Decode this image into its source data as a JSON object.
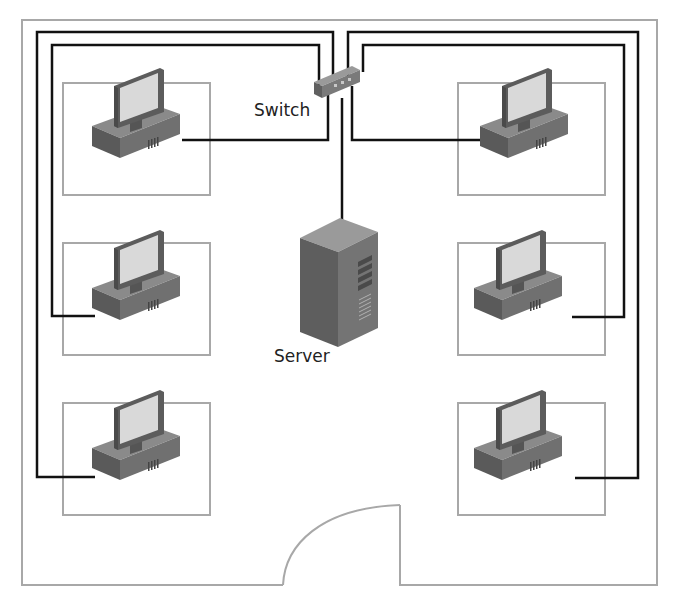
{
  "diagram": {
    "type": "network floor plan",
    "labels": {
      "switch": "Switch",
      "server": "Server"
    },
    "nodes": [
      {
        "id": "switch",
        "kind": "switch",
        "label": "Switch"
      },
      {
        "id": "server",
        "kind": "server",
        "label": "Server"
      },
      {
        "id": "pc-left-1",
        "kind": "workstation"
      },
      {
        "id": "pc-left-2",
        "kind": "workstation"
      },
      {
        "id": "pc-left-3",
        "kind": "workstation"
      },
      {
        "id": "pc-right-1",
        "kind": "workstation"
      },
      {
        "id": "pc-right-2",
        "kind": "workstation"
      },
      {
        "id": "pc-right-3",
        "kind": "workstation"
      }
    ],
    "edges": [
      [
        "switch",
        "server"
      ],
      [
        "switch",
        "pc-left-1"
      ],
      [
        "switch",
        "pc-left-2"
      ],
      [
        "switch",
        "pc-left-3"
      ],
      [
        "switch",
        "pc-right-1"
      ],
      [
        "switch",
        "pc-right-2"
      ],
      [
        "switch",
        "pc-right-3"
      ]
    ],
    "colors": {
      "wall": "#a8a8a8",
      "desk": "#a0a0a0",
      "cable": "#111111",
      "device_body": "#6e6e6e",
      "screen": "#d8d8d8"
    }
  }
}
